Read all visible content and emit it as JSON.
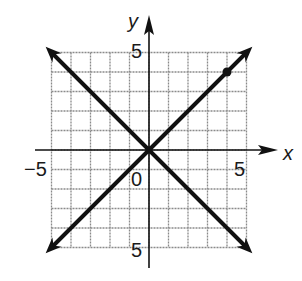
{
  "chart_data": {
    "type": "line",
    "title": "",
    "xlabel": "x",
    "ylabel": "y",
    "xlim": [
      -5,
      5
    ],
    "ylim": [
      -5,
      5
    ],
    "grid": true,
    "grid_step": 1,
    "tick_labels": {
      "x": [
        {
          "value": -5,
          "label": "−5"
        },
        {
          "value": 5,
          "label": "5"
        }
      ],
      "y": [
        {
          "value": 5,
          "label": "5"
        },
        {
          "value": -5,
          "label": "5"
        }
      ],
      "origin": "0"
    },
    "series": [
      {
        "name": "y = x",
        "x": [
          -5.3,
          5.3
        ],
        "y": [
          -5.3,
          5.3
        ],
        "arrows": "both"
      },
      {
        "name": "y = -x",
        "x": [
          -5.3,
          5.3
        ],
        "y": [
          5.3,
          -5.3
        ],
        "arrows": "both"
      }
    ],
    "points": [
      {
        "x": 4,
        "y": 4,
        "series": "y = x"
      }
    ]
  },
  "colors": {
    "line": "#111111",
    "grid": "#8a8a8a",
    "axis": "#111111",
    "background": "#ffffff"
  },
  "layout": {
    "origin_px": [
      149,
      150
    ],
    "unit_px": 19.5
  }
}
